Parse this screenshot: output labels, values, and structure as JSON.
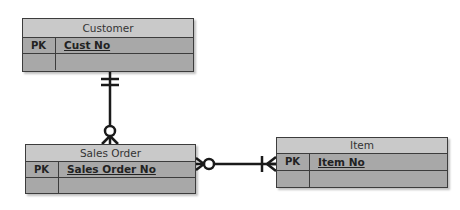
{
  "diagram": {
    "type": "entity-relationship",
    "colors": {
      "header": "#c9c9c9",
      "row": "#a8a8a8",
      "border": "#3c3c3c",
      "line": "#1a1a1a"
    },
    "entities": [
      {
        "name": "Customer",
        "rows": [
          {
            "key": "PK",
            "attribute": "Cust No"
          },
          {
            "key": "",
            "attribute": ""
          }
        ]
      },
      {
        "name": "Sales Order",
        "rows": [
          {
            "key": "PK",
            "attribute": "Sales Order No"
          },
          {
            "key": "",
            "attribute": ""
          }
        ]
      },
      {
        "name": "Item",
        "rows": [
          {
            "key": "PK",
            "attribute": "Item No"
          },
          {
            "key": "",
            "attribute": ""
          }
        ]
      }
    ],
    "relationships": [
      {
        "from": "Customer",
        "to": "Sales Order",
        "from_cardinality": "one-and-only-one",
        "to_cardinality": "zero-or-many"
      },
      {
        "from": "Sales Order",
        "to": "Item",
        "from_cardinality": "zero-or-many",
        "to_cardinality": "one-or-many"
      }
    ]
  }
}
